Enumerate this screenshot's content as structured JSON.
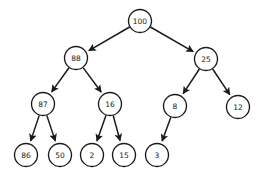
{
  "figure": {
    "type": "binary-tree-diagram",
    "background_color": "#ffffff",
    "node_fill_color": "#ffffff",
    "node_stroke_color": "#1a1a1a",
    "edge_color": "#1a1a1a",
    "label_color": "#1a1a1a",
    "width": 264,
    "height": 180
  },
  "chart_data": {
    "type": "diagram",
    "title": "",
    "subtitle": "",
    "xlabel": "",
    "ylabel": "",
    "legend": [],
    "annotations": [],
    "root": "n100",
    "levels": 4,
    "node_count": 13,
    "edge_count": 12,
    "nodes": [
      {
        "id": "n100",
        "label": "100",
        "x": 140,
        "y": 21,
        "r": 11.5,
        "level": 0,
        "font_size": 7.5
      },
      {
        "id": "n88",
        "label": "88",
        "x": 76,
        "y": 58,
        "r": 11.5,
        "level": 1,
        "font_size": 7.5
      },
      {
        "id": "n25",
        "label": "25",
        "x": 206,
        "y": 59,
        "r": 11.5,
        "level": 1,
        "font_size": 7.5
      },
      {
        "id": "n87",
        "label": "87",
        "x": 43,
        "y": 104,
        "r": 11.5,
        "level": 2,
        "font_size": 7.5
      },
      {
        "id": "n16",
        "label": "16",
        "x": 110,
        "y": 104,
        "r": 11.5,
        "level": 2,
        "font_size": 7.5
      },
      {
        "id": "n8",
        "label": "8",
        "x": 175,
        "y": 106,
        "r": 11.5,
        "level": 2,
        "font_size": 7.5
      },
      {
        "id": "n12",
        "label": "12",
        "x": 238,
        "y": 107,
        "r": 11.5,
        "level": 2,
        "font_size": 7.5
      },
      {
        "id": "n86",
        "label": "86",
        "x": 26,
        "y": 155,
        "r": 11.5,
        "level": 3,
        "font_size": 7.5
      },
      {
        "id": "n50",
        "label": "50",
        "x": 60,
        "y": 155,
        "r": 11.5,
        "level": 3,
        "font_size": 7.5
      },
      {
        "id": "n2",
        "label": "2",
        "x": 92,
        "y": 155,
        "r": 11.5,
        "level": 3,
        "font_size": 7.5
      },
      {
        "id": "n15",
        "label": "15",
        "x": 124,
        "y": 155,
        "r": 11.5,
        "level": 3,
        "font_size": 7.5
      },
      {
        "id": "n3",
        "label": "3",
        "x": 157,
        "y": 155,
        "r": 11.5,
        "level": 3,
        "font_size": 7.5
      }
    ],
    "edges": [
      {
        "from": "n100",
        "to": "n88",
        "directed": true,
        "side": "left"
      },
      {
        "from": "n100",
        "to": "n25",
        "directed": true,
        "side": "right"
      },
      {
        "from": "n88",
        "to": "n87",
        "directed": true,
        "side": "left"
      },
      {
        "from": "n88",
        "to": "n16",
        "directed": true,
        "side": "right"
      },
      {
        "from": "n25",
        "to": "n8",
        "directed": true,
        "side": "left"
      },
      {
        "from": "n25",
        "to": "n12",
        "directed": true,
        "side": "right"
      },
      {
        "from": "n87",
        "to": "n86",
        "directed": true,
        "side": "left"
      },
      {
        "from": "n87",
        "to": "n50",
        "directed": true,
        "side": "right"
      },
      {
        "from": "n16",
        "to": "n2",
        "directed": true,
        "side": "left"
      },
      {
        "from": "n16",
        "to": "n15",
        "directed": true,
        "side": "right"
      },
      {
        "from": "n8",
        "to": "n3",
        "directed": true,
        "side": "left"
      }
    ],
    "values": [
      100,
      88,
      25,
      87,
      16,
      8,
      12,
      86,
      50,
      2,
      15,
      3
    ],
    "categories": [
      "100",
      "88",
      "25",
      "87",
      "16",
      "8",
      "12",
      "86",
      "50",
      "2",
      "15",
      "3"
    ]
  }
}
